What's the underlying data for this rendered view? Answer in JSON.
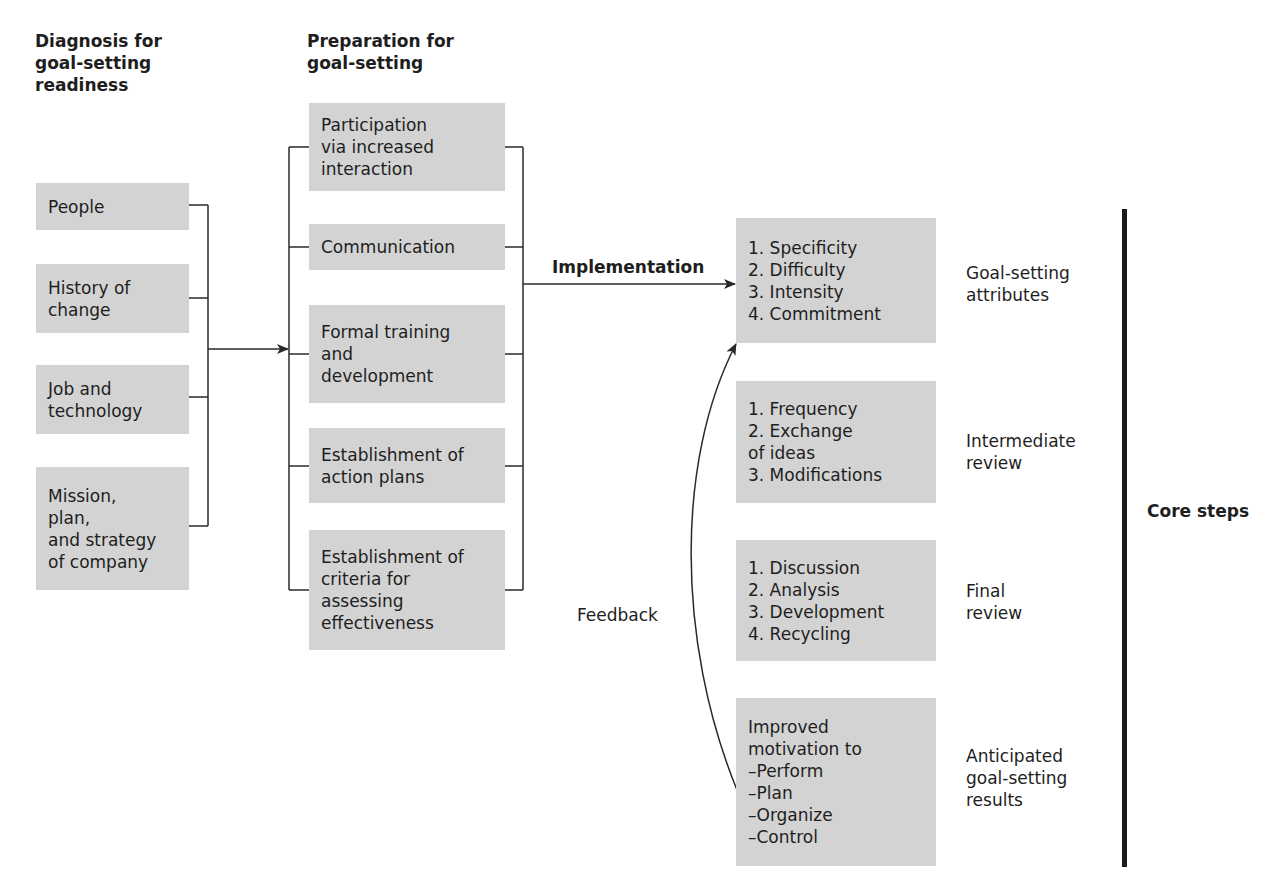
{
  "columns": {
    "diagnosis": {
      "header": "Diagnosis for\ngoal-setting\nreadiness",
      "items": [
        {
          "label": "People"
        },
        {
          "label": "History of\nchange"
        },
        {
          "label": "Job and\ntechnology"
        },
        {
          "label": "Mission,\nplan,\nand strategy\nof company"
        }
      ]
    },
    "preparation": {
      "header": "Preparation for\ngoal-setting",
      "items": [
        {
          "label": "Participation\nvia increased\ninteraction"
        },
        {
          "label": "Communication"
        },
        {
          "label": "Formal training\nand\ndevelopment"
        },
        {
          "label": "Establishment of\naction plans"
        },
        {
          "label": "Establishment of\ncriteria for\nassessing\neffectiveness"
        }
      ]
    },
    "core": {
      "implementation_label": "Implementation",
      "feedback_label": "Feedback",
      "core_steps_label": "Core steps",
      "stages": [
        {
          "content": "1. Specificity\n2. Difficulty\n3. Intensity\n4. Commitment",
          "label": "Goal-setting\nattributes"
        },
        {
          "content": "1. Frequency\n2. Exchange\n    of ideas\n3. Modifications",
          "label": "Intermediate\nreview"
        },
        {
          "content": "1. Discussion\n2. Analysis\n3. Development\n4. Recycling",
          "label": "Final\nreview"
        },
        {
          "content": "Improved\nmotivation to\n–Perform\n–Plan\n–Organize\n–Control",
          "label": "Anticipated\ngoal-setting\nresults"
        }
      ]
    }
  },
  "colors": {
    "box_fill": "#d3d3d3",
    "line": "#2a2a2a",
    "text": "#1e1e1e"
  }
}
